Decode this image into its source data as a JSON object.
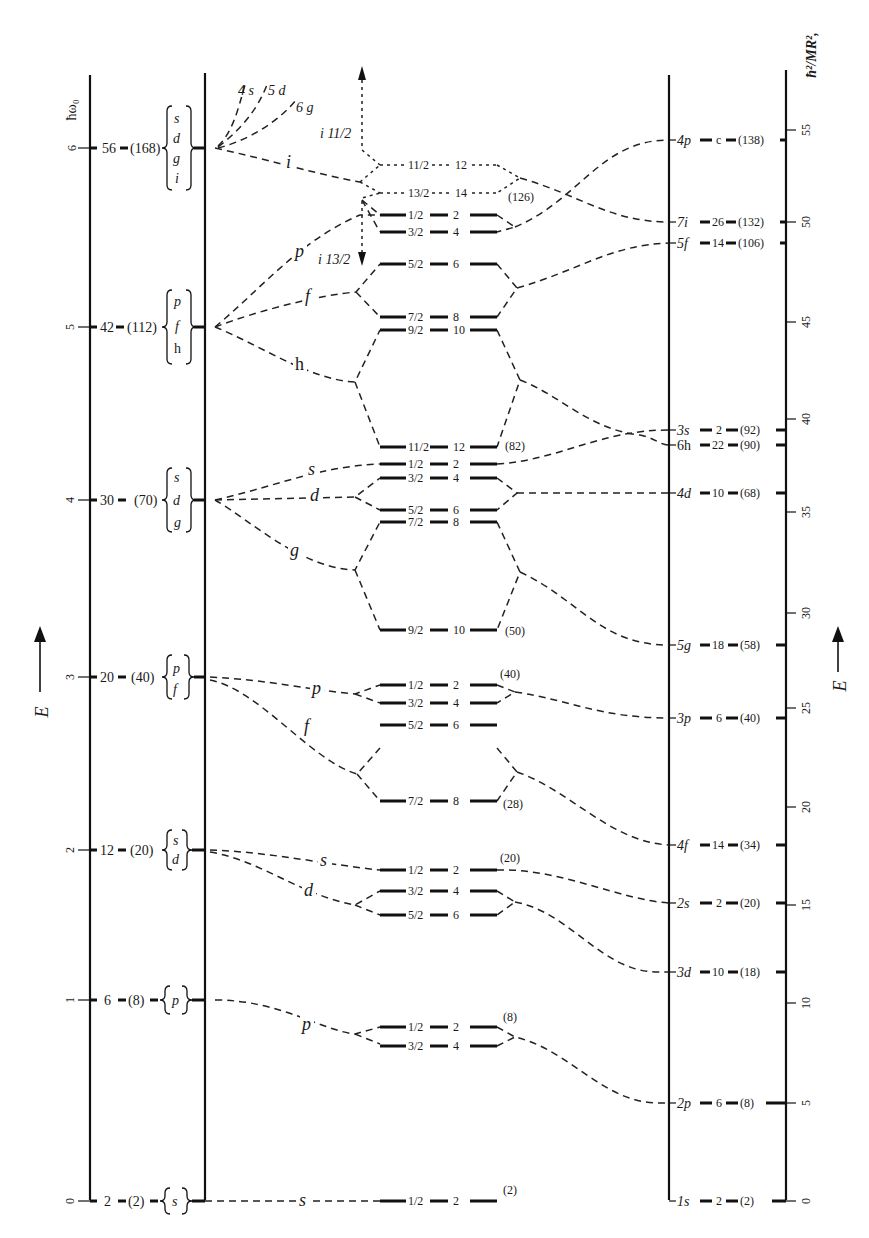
{
  "left_axis": {
    "label": "E",
    "unit_label": "ħω₀",
    "ticks": [
      "0",
      "1",
      "2",
      "3",
      "4",
      "5",
      "6"
    ]
  },
  "right_axis": {
    "label": "E",
    "unit_label": "ħ²/MR²,",
    "ticks": [
      "0",
      "5",
      "10",
      "15",
      "20",
      "25",
      "30",
      "35",
      "40",
      "45",
      "50",
      "55"
    ]
  },
  "oscillator_levels": [
    {
      "n": "0",
      "count": "2",
      "total": "(2)",
      "l": [
        "s"
      ]
    },
    {
      "n": "1",
      "count": "6",
      "total": "(8)",
      "l": [
        "p"
      ]
    },
    {
      "n": "2",
      "count": "12",
      "total": "(20)",
      "l": [
        "s",
        "d"
      ]
    },
    {
      "n": "3",
      "count": "20",
      "total": "(40)",
      "l": [
        "p",
        "f"
      ]
    },
    {
      "n": "4",
      "count": "30",
      "total": "(70)",
      "l": [
        "s",
        "d",
        "g"
      ]
    },
    {
      "n": "5",
      "count": "42",
      "total": "(112)",
      "l": [
        "p",
        "f",
        "h"
      ]
    },
    {
      "n": "6",
      "count": "56",
      "total": "(168)",
      "l": [
        "s",
        "d",
        "g",
        "i"
      ]
    }
  ],
  "top_labels": {
    "s4": "4 s",
    "d5": "5 d",
    "g6": "6 g",
    "i11": "i 11/2",
    "i13": "i 13/2"
  },
  "branch_labels": {
    "s0": "s",
    "p1": "p",
    "s2": "s",
    "d2": "d",
    "p3": "p",
    "f3": "f",
    "s4": "s",
    "d4": "d",
    "g4": "g",
    "p5": "p",
    "f5": "f",
    "h5": "h",
    "i6": "i"
  },
  "spin_orbit_levels": [
    {
      "j": "1/2",
      "n": "2"
    },
    {
      "j": "3/2",
      "n": "4"
    },
    {
      "j": "1/2",
      "n": "2"
    },
    {
      "j": "5/2",
      "n": "6"
    },
    {
      "j": "3/2",
      "n": "4"
    },
    {
      "j": "1/2",
      "n": "2"
    },
    {
      "j": "7/2",
      "n": "8"
    },
    {
      "j": "5/2",
      "n": "6"
    },
    {
      "j": "3/2",
      "n": "4"
    },
    {
      "j": "1/2",
      "n": "2"
    },
    {
      "j": "9/2",
      "n": "10"
    },
    {
      "j": "7/2",
      "n": "8"
    },
    {
      "j": "5/2",
      "n": "6"
    },
    {
      "j": "3/2",
      "n": "4"
    },
    {
      "j": "1/2",
      "n": "2"
    },
    {
      "j": "11/2",
      "n": "12"
    },
    {
      "j": "9/2",
      "n": "10"
    },
    {
      "j": "7/2",
      "n": "8"
    },
    {
      "j": "5/2",
      "n": "6"
    },
    {
      "j": "3/2",
      "n": "4"
    },
    {
      "j": "1/2",
      "n": "2"
    },
    {
      "j": "13/2",
      "n": "14"
    },
    {
      "j": "11/2",
      "n": "12"
    }
  ],
  "magic_numbers": [
    "(2)",
    "(8)",
    "(20)",
    "(28)",
    "(40)",
    "(50)",
    "(82)",
    "(126)"
  ],
  "square_well_levels": [
    {
      "name": "1s",
      "count": "2",
      "total": "(2)"
    },
    {
      "name": "2p",
      "count": "6",
      "total": "(8)"
    },
    {
      "name": "3d",
      "count": "10",
      "total": "(18)"
    },
    {
      "name": "2s",
      "count": "2",
      "total": "(20)"
    },
    {
      "name": "4f",
      "count": "14",
      "total": "(34)"
    },
    {
      "name": "3p",
      "count": "6",
      "total": "(40)"
    },
    {
      "name": "5g",
      "count": "18",
      "total": "(58)"
    },
    {
      "name": "4d",
      "count": "10",
      "total": "(68)"
    },
    {
      "name": "6h",
      "count": "22",
      "total": "(90)"
    },
    {
      "name": "3s",
      "count": "2",
      "total": "(92)"
    },
    {
      "name": "5f",
      "count": "14",
      "total": "(106)"
    },
    {
      "name": "7i",
      "count": "26",
      "total": "(132)"
    },
    {
      "name": "4p",
      "count": "c",
      "total": "(138)"
    }
  ]
}
